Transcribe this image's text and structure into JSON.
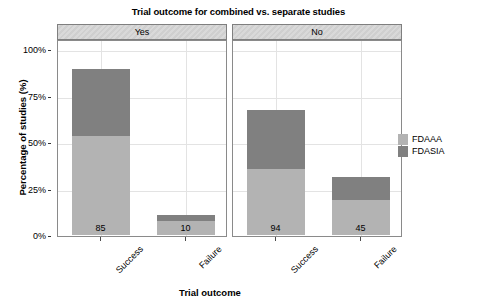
{
  "chart_data": {
    "type": "bar",
    "subtype": "stacked-bar-faceted",
    "title": "Trial outcome for combined vs. separate studies",
    "xlabel": "Trial outcome",
    "ylabel": "Percentage of studies (%)",
    "ylim": [
      0,
      100
    ],
    "yticks": [
      0,
      25,
      50,
      75,
      100
    ],
    "ytick_labels": [
      "0%",
      "25%",
      "50%",
      "75%",
      "100%"
    ],
    "grid": true,
    "legend_position": "right",
    "facet_variable": "Combined study",
    "facets": [
      {
        "label": "Yes",
        "categories": [
          "Success",
          "Failure"
        ],
        "bars": [
          {
            "category": "Success",
            "data_label": "85",
            "total_percent": 89.5,
            "segments": [
              {
                "series": "FDAAA",
                "percent": 53.0
              },
              {
                "series": "FDASIA",
                "percent": 36.5
              }
            ]
          },
          {
            "category": "Failure",
            "data_label": "10",
            "total_percent": 10.5,
            "segments": [
              {
                "series": "FDAAA",
                "percent": 7.5
              },
              {
                "series": "FDASIA",
                "percent": 3.0
              }
            ]
          }
        ]
      },
      {
        "label": "No",
        "categories": [
          "Success",
          "Failure"
        ],
        "bars": [
          {
            "category": "Success",
            "data_label": "94",
            "total_percent": 67.0,
            "segments": [
              {
                "series": "FDAAA",
                "percent": 35.5
              },
              {
                "series": "FDASIA",
                "percent": 31.5
              }
            ]
          },
          {
            "category": "Failure",
            "data_label": "45",
            "total_percent": 31.0,
            "segments": [
              {
                "series": "FDAAA",
                "percent": 19.0
              },
              {
                "series": "FDASIA",
                "percent": 12.0
              }
            ]
          }
        ]
      }
    ],
    "series": [
      {
        "name": "FDAAA",
        "color": "#b3b3b3"
      },
      {
        "name": "FDASIA",
        "color": "#808080"
      }
    ],
    "legend": {
      "title": "",
      "entries": [
        {
          "label": "FDAAA",
          "color": "#b3b3b3"
        },
        {
          "label": "FDASIA",
          "color": "#808080"
        }
      ]
    }
  },
  "colors": {
    "fdaaa": "#b3b3b3",
    "fdasia": "#808080",
    "panel_strip": "#d4d4d4",
    "grid": "#e3e3e3",
    "frame": "#8a8a8a",
    "text": "#000000"
  }
}
